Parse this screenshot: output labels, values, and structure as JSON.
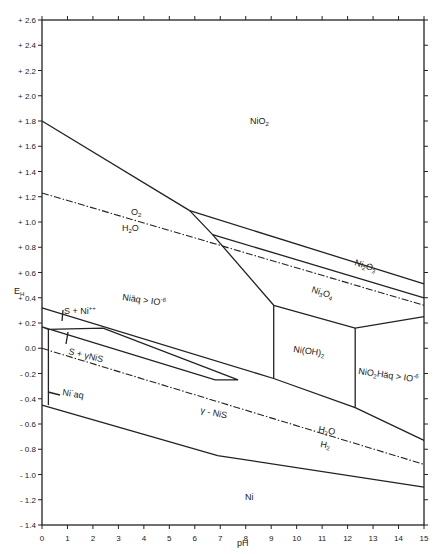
{
  "chart_data": {
    "type": "line",
    "title": "",
    "xlabel": "pH",
    "ylabel": "EH",
    "xlim": [
      0,
      15
    ],
    "ylim": [
      -1.4,
      2.6
    ],
    "x_ticks": [
      "0",
      "1",
      "2",
      "3",
      "4",
      "5",
      "6",
      "7",
      "8",
      "9",
      "10",
      "11",
      "12",
      "13",
      "14",
      "15"
    ],
    "y_ticks": [
      "+ 2.6",
      "+ 2.4",
      "+ 2.2",
      "+ 2.0",
      "+ 1.8",
      "+ 1.6",
      "+ 1.4",
      "+ 1.2",
      "+ 1.0",
      "+ 0.8",
      "+ 0.6",
      "+ 0.4",
      "+ 0.2",
      "0.0",
      "- 0.2",
      "- 0.4",
      "- 0.6",
      "- 0.8",
      "- 1.0",
      "- 1.2",
      "- 1.4"
    ],
    "grid": false,
    "series": [
      {
        "name": "NiO2 / Ni2O3 boundary (upper)",
        "style": "solid",
        "points": [
          [
            0,
            1.8
          ],
          [
            5.8,
            1.09
          ]
        ]
      },
      {
        "name": "Ni2O3 upper boundary",
        "style": "solid",
        "points": [
          [
            5.8,
            1.09
          ],
          [
            15,
            0.51
          ]
        ]
      },
      {
        "name": "NiO2 / lower oxides diagonal",
        "style": "solid",
        "points": [
          [
            5.8,
            1.09
          ],
          [
            6.7,
            0.9
          ],
          [
            9.1,
            0.34
          ]
        ]
      },
      {
        "name": "Ni2O3 / Ni3O4 boundary",
        "style": "solid",
        "points": [
          [
            6.7,
            0.9
          ],
          [
            15,
            0.4
          ]
        ]
      },
      {
        "name": "O2 / H2O",
        "style": "dash-dot",
        "points": [
          [
            0,
            1.23
          ],
          [
            15,
            0.34
          ]
        ]
      },
      {
        "name": "Ni3O4 / Ni(OH)2 boundary",
        "style": "solid",
        "points": [
          [
            9.1,
            0.34
          ],
          [
            12.3,
            0.16
          ],
          [
            15,
            0.25
          ]
        ]
      },
      {
        "name": "Ni++aq upper boundary",
        "style": "solid",
        "points": [
          [
            0,
            0.32
          ],
          [
            9.1,
            -0.24
          ],
          [
            12.3,
            -0.47
          ],
          [
            15,
            -0.73
          ]
        ]
      },
      {
        "name": "Ni(OH)2 left boundary",
        "style": "solid",
        "points": [
          [
            9.1,
            0.34
          ],
          [
            9.1,
            -0.24
          ]
        ]
      },
      {
        "name": "Ni(OH)2 right boundary",
        "style": "solid",
        "points": [
          [
            12.3,
            0.16
          ],
          [
            12.3,
            -0.47
          ]
        ]
      },
      {
        "name": "S + NiS wedge",
        "style": "solid",
        "points": [
          [
            0,
            0.17
          ],
          [
            0.25,
            0.15
          ],
          [
            2.4,
            0.16
          ],
          [
            7.7,
            -0.25
          ],
          [
            6.8,
            -0.25
          ],
          [
            0,
            0.17
          ]
        ]
      },
      {
        "name": "S + NiS vertical",
        "style": "solid",
        "points": [
          [
            0.25,
            0.15
          ],
          [
            0.25,
            -0.45
          ]
        ]
      },
      {
        "name": "H2O / H2",
        "style": "dash-dot",
        "points": [
          [
            0,
            0.0
          ],
          [
            15,
            -0.92
          ]
        ]
      },
      {
        "name": "NiS / Ni boundary",
        "style": "solid",
        "points": [
          [
            0,
            -0.45
          ],
          [
            6.9,
            -0.85
          ],
          [
            15,
            -1.1
          ]
        ]
      }
    ],
    "annotations": [
      {
        "text": "NiO2",
        "x": 8.6,
        "y": 1.84
      },
      {
        "text": "O2",
        "x": 3.5,
        "y": 1.05
      },
      {
        "text": "H2O",
        "x": 3.4,
        "y": 0.93
      },
      {
        "text": "Ni2O3",
        "x": 12.2,
        "y": 0.67
      },
      {
        "text": "Ni3O4",
        "x": 12.3,
        "y": 0.45
      },
      {
        "text": "Ni++aq > 10-6",
        "x": 4.0,
        "y": 0.39
      },
      {
        "text": "S + Ni++",
        "x": 1.0,
        "y": 0.28
      },
      {
        "text": "S + NiS",
        "x": 1.4,
        "y": 0.03
      },
      {
        "text": "Ni(OH)2",
        "x": 10.2,
        "y": 0.05
      },
      {
        "text": "NiO2H-aq > 10-6",
        "x": 12.8,
        "y": -0.25
      },
      {
        "text": "Ni++aq",
        "x": 0.8,
        "y": -0.32
      },
      {
        "text": "NiS",
        "x": 6.0,
        "y": -0.48
      },
      {
        "text": "H2O",
        "x": 10.3,
        "y": -0.58
      },
      {
        "text": "H2",
        "x": 10.3,
        "y": -0.68
      },
      {
        "text": "Ni",
        "x": 9.8,
        "y": -1.05
      }
    ]
  },
  "labels": {
    "x_axis_title": "pH",
    "y_axis_title": "E",
    "y_axis_title_sub": "H",
    "niO2": "NiO",
    "niO2_sub": "2",
    "o2": "O",
    "o2_sub": "2",
    "h2o_upper": "H",
    "h2o_upper_sub": "2",
    "h2o_upper_tail": "O",
    "ni2o3": "Ni",
    "ni2o3_sub1": "2",
    "ni2o3_mid": "O",
    "ni2o3_sub2": "3",
    "ni3o4": "Ni",
    "ni3o4_sub1": "3",
    "ni3o4_mid": "O",
    "ni3o4_sub2": "4",
    "niaq_main": "Niäq > IO",
    "niaq_sup": "-6",
    "s_ni": "S + Ni",
    "s_ni_sup": "++",
    "s_nis": "S  + γNiS",
    "nioh2": "Ni(OH)",
    "nioh2_sub": "2",
    "nio2h": "NiO",
    "nio2h_sub": "2",
    "nio2h_tail": "Häq > IO",
    "nio2h_sup": "-6",
    "niaq_low": "Ni˙aq",
    "nis": "γ - NiS",
    "h2o_lower": "H",
    "h2o_lower_sub": "2",
    "h2o_lower_tail": "O",
    "h2": "H",
    "h2_sub": "2",
    "ni": "Ni"
  }
}
